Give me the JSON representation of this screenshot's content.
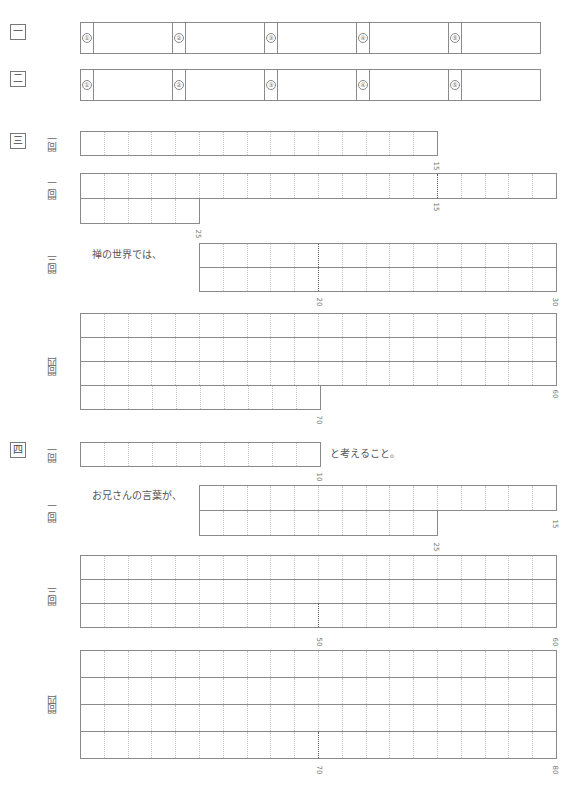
{
  "header": {
    "faint_text": ""
  },
  "sections": [
    {
      "label": "一",
      "type": "choices",
      "choices": [
        "①",
        "②",
        "③",
        "④",
        "⑤"
      ]
    },
    {
      "label": "二",
      "type": "choices",
      "choices": [
        "①",
        "②",
        "③",
        "④",
        "⑤"
      ]
    },
    {
      "label": "三",
      "questions": [
        {
          "label": "問一",
          "cells": 15,
          "markers": [
            "15"
          ]
        },
        {
          "label": "問二",
          "cells": 25,
          "markers": [
            "15",
            "25"
          ]
        },
        {
          "label": "問三",
          "prefix": "禅の世界では、",
          "cells": 30,
          "markers": [
            "20",
            "30"
          ]
        },
        {
          "label": "問四",
          "cells": 70,
          "markers": [
            "60",
            "70"
          ]
        }
      ]
    },
    {
      "label": "四",
      "questions": [
        {
          "label": "問一",
          "cells": 10,
          "markers": [
            "10"
          ],
          "suffix": "と考えること。"
        },
        {
          "label": "問二",
          "prefix": "お兄さんの言葉が、",
          "cells": 25,
          "markers": [
            "15",
            "25"
          ]
        },
        {
          "label": "問三",
          "cells": 60,
          "markers": [
            "50",
            "60"
          ]
        },
        {
          "label": "問四",
          "cells": 80,
          "markers": [
            "70",
            "80"
          ]
        }
      ]
    }
  ],
  "colors": {
    "line": "#8a8a8a",
    "dotted": "#c4c4c4",
    "text": "#555555"
  }
}
